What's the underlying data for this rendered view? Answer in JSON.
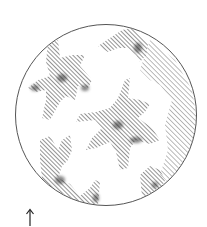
{
  "figure": {
    "field_circle": {
      "cx": 106,
      "cy": 115,
      "r": 91,
      "stroke": "#555555"
    },
    "hatch_color": "#3a3a3a",
    "shade_color": "#222222",
    "orientation_arrow": {
      "symbol": "↑",
      "x": 30,
      "y": 212
    }
  }
}
